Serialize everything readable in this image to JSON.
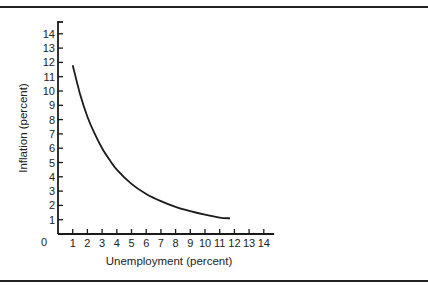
{
  "chart_data": {
    "type": "line",
    "title": "",
    "xlabel": "Unemployment (percent)",
    "ylabel": "Inflation (percent)",
    "xlim": [
      0,
      14
    ],
    "ylim": [
      0,
      14
    ],
    "origin_label": "0",
    "x_ticks": [
      "1",
      "2",
      "3",
      "4",
      "5",
      "6",
      "7",
      "8",
      "9",
      "10",
      "11",
      "12",
      "13",
      "14"
    ],
    "y_ticks": [
      "1",
      "2",
      "3",
      "4",
      "5",
      "6",
      "7",
      "8",
      "9",
      "10",
      "11",
      "12",
      "13",
      "14"
    ],
    "grid": false,
    "legend": null,
    "series": [
      {
        "name": "Phillips curve",
        "x": [
          1,
          1.5,
          2,
          2.5,
          3,
          3.5,
          4,
          5,
          6,
          7,
          8,
          9,
          10,
          11,
          11.7
        ],
        "y": [
          11.8,
          9.8,
          8.2,
          7.0,
          6.0,
          5.2,
          4.5,
          3.5,
          2.8,
          2.3,
          1.9,
          1.6,
          1.35,
          1.15,
          1.1
        ]
      }
    ]
  }
}
